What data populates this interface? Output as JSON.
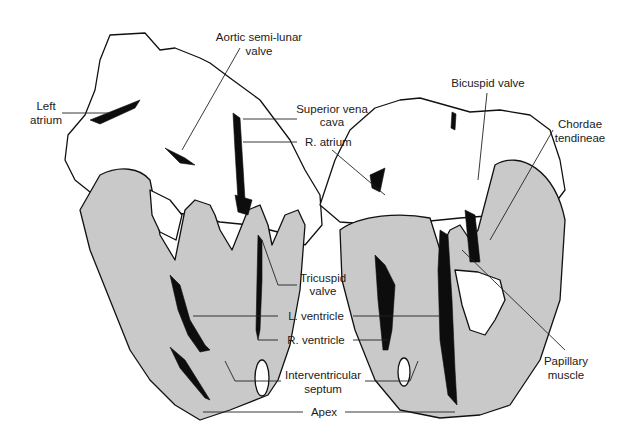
{
  "figure": {
    "colors": {
      "myocardium_fill": "#c9c9c9",
      "cavity_fill": "#0d0d0d",
      "outline": "#111111",
      "background": "#ffffff"
    },
    "labels": {
      "left_atrium": [
        "Left",
        "atrium"
      ],
      "aortic_valve": [
        "Aortic semi-lunar",
        "valve"
      ],
      "superior_vena_cava": [
        "Superior vena",
        "cava"
      ],
      "r_atrium": "R. atrium",
      "tricuspid_valve": [
        "Tricuspid",
        "valve"
      ],
      "l_ventricle": "L. ventricle",
      "r_ventricle": "R. ventricle",
      "interventricular_septum": [
        "Interventricular",
        "septum"
      ],
      "apex": "Apex",
      "bicuspid_valve": "Bicuspid valve",
      "chordae_tendineae": [
        "Chordae",
        "tendineae"
      ],
      "papillary_muscle": [
        "Papillary",
        "muscle"
      ]
    }
  }
}
